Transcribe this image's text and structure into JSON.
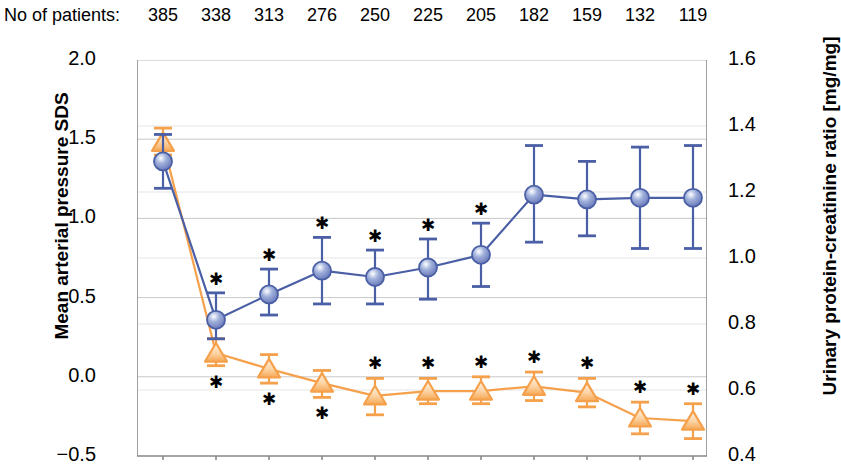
{
  "header": {
    "patients_label": "No of patients:",
    "patient_counts": [
      "385",
      "338",
      "313",
      "276",
      "250",
      "225",
      "205",
      "182",
      "159",
      "132",
      "119"
    ]
  },
  "axes": {
    "left_title": "Mean arterial pressure SDS",
    "right_title": "Urinary protein-creatinine ratio [mg/mg]",
    "left_ticks": [
      "2.0",
      "1.5",
      "1.0",
      "0.5",
      "0.0",
      "−0.5"
    ],
    "right_ticks": [
      "1.6",
      "1.4",
      "1.2",
      "1.0",
      "0.8",
      "0.6",
      "0.4"
    ]
  },
  "colors": {
    "map_series": "#4a5fa5",
    "map_marker_fill": "#8e9ccd",
    "upcr_series": "#f5a04b",
    "upcr_marker_fill": "#fde3c4",
    "gridline": "#c8c8c8",
    "axis": "#8a8a8a",
    "star": "#000000"
  },
  "chart_data": {
    "type": "line",
    "title": "",
    "xlabel": "",
    "ylabel": "Mean arterial pressure SDS",
    "y2label": "Urinary protein-creatinine ratio [mg/mg]",
    "ylim": [
      -0.5,
      2.0
    ],
    "y2lim": [
      0.4,
      1.6
    ],
    "yticks": [
      -0.5,
      0.0,
      0.5,
      1.0,
      1.5,
      2.0
    ],
    "y2ticks": [
      0.4,
      0.6,
      0.8,
      1.0,
      1.2,
      1.4,
      1.6
    ],
    "grid": true,
    "legend": "none",
    "x": [
      1,
      2,
      3,
      4,
      5,
      6,
      7,
      8,
      9,
      10,
      11
    ],
    "x_tick_labels": [
      "",
      "",
      "",
      "",
      "",
      "",
      "",
      "",
      "",
      "",
      ""
    ],
    "n_patients": [
      385,
      338,
      313,
      276,
      250,
      225,
      205,
      182,
      159,
      132,
      119
    ],
    "series": [
      {
        "name": "Mean arterial pressure SDS",
        "axis": "left",
        "marker": "circle",
        "color": "#4a5fa5",
        "values": [
          1.36,
          0.36,
          0.52,
          0.67,
          0.63,
          0.69,
          0.77,
          1.15,
          1.12,
          1.13,
          1.13
        ],
        "err_low": [
          1.19,
          0.24,
          0.39,
          0.46,
          0.46,
          0.49,
          0.57,
          0.85,
          0.89,
          0.81,
          0.81
        ],
        "err_high": [
          1.53,
          0.53,
          0.68,
          0.88,
          0.8,
          0.87,
          0.97,
          1.46,
          1.36,
          1.45,
          1.46
        ],
        "significance": [
          "",
          "*",
          "*",
          "*",
          "*",
          "*",
          "*",
          "",
          "",
          "",
          ""
        ]
      },
      {
        "name": "Urinary protein-creatinine ratio [mg/mg]",
        "axis": "right",
        "marker": "triangle",
        "color": "#f5a04b",
        "values_left_scale": [
          1.48,
          0.15,
          0.05,
          -0.04,
          -0.12,
          -0.09,
          -0.09,
          -0.06,
          -0.1,
          -0.26,
          -0.28
        ],
        "err_low_left_scale": [
          1.4,
          0.07,
          -0.04,
          -0.13,
          -0.24,
          -0.17,
          -0.17,
          -0.15,
          -0.19,
          -0.36,
          -0.39
        ],
        "err_high_left_scale": [
          1.57,
          0.24,
          0.14,
          0.04,
          -0.01,
          -0.01,
          0.0,
          0.03,
          -0.01,
          -0.16,
          -0.17
        ],
        "values": [
          1.347,
          0.71,
          0.662,
          0.621,
          0.582,
          0.597,
          0.597,
          0.611,
          0.592,
          0.515,
          0.506
        ],
        "significance": [
          "",
          "*",
          "*",
          "*",
          "*",
          "*",
          "*",
          "*",
          "*",
          "*",
          "*"
        ]
      }
    ]
  }
}
